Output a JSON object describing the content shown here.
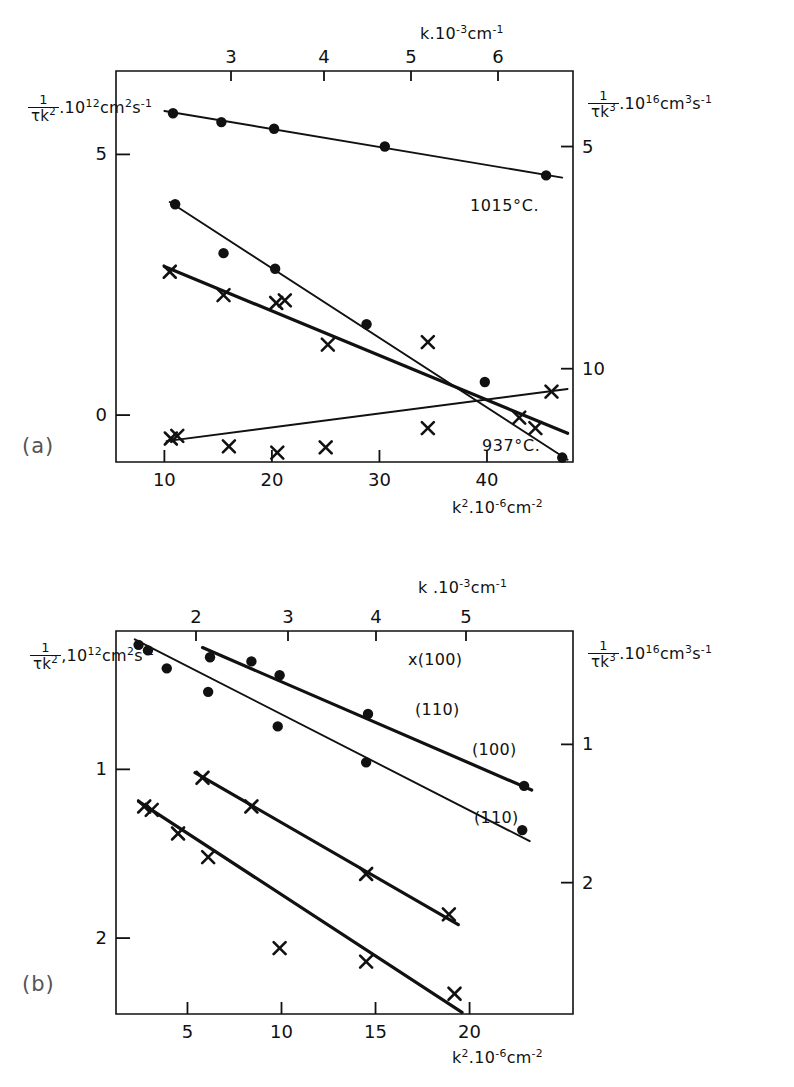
{
  "figure": {
    "background": "#ffffff",
    "ink": "#111111",
    "panels": [
      "a",
      "b"
    ]
  },
  "panel_a": {
    "label": "(a)",
    "top_axis": {
      "title_k": "k",
      "title_dot": ".",
      "title_base": "10",
      "title_exp": "-3",
      "title_unit": "cm",
      "title_unit_exp": "-1",
      "ticks": [
        "3",
        "4",
        "5",
        "6"
      ]
    },
    "bottom_axis": {
      "title_k": "k",
      "title_k_exp": "2",
      "title_dot": ".",
      "title_base": "10",
      "title_exp": "-6",
      "title_unit": "cm",
      "title_unit_exp": "-2",
      "ticks": [
        "10",
        "20",
        "30",
        "40"
      ]
    },
    "left_axis": {
      "num": "1",
      "den": "τk",
      "den_exp": "2",
      "dot": ".",
      "base": "10",
      "exp": "12",
      "unit1": "cm",
      "unit1_exp": "2",
      "unit2": "s",
      "unit2_exp": "-1",
      "ticks": [
        "0",
        "5"
      ]
    },
    "right_axis": {
      "num": "1",
      "den": "τk",
      "den_exp": "3",
      "dot": ".",
      "base": "10",
      "exp": "16",
      "unit1": "cm",
      "unit1_exp": "3",
      "unit2": "s",
      "unit2_exp": "-1",
      "ticks": [
        "10",
        "5"
      ]
    },
    "annotations": [
      {
        "text": "1015°C.",
        "name": "temp-label-1015"
      },
      {
        "text": "937°C.",
        "name": "temp-label-937"
      }
    ]
  },
  "panel_b": {
    "label": "(b)",
    "top_axis": {
      "title_k": "k",
      "title_dot": ".",
      "title_base": "10",
      "title_exp": "-3",
      "title_unit": "cm",
      "title_unit_exp": "-1",
      "ticks": [
        "2",
        "3",
        "4",
        "5"
      ]
    },
    "bottom_axis": {
      "title_k": "k",
      "title_k_exp": "2",
      "title_dot": ".",
      "title_base": "10",
      "title_exp": "-6",
      "title_unit": "cm",
      "title_unit_exp": "-2",
      "ticks": [
        "5",
        "10",
        "15",
        "20"
      ]
    },
    "left_axis": {
      "num": "1",
      "den": "τk",
      "den_exp": "2",
      "dot": ",",
      "base": "10",
      "exp": "12",
      "unit1": "cm",
      "unit1_exp": "2",
      "unit2": "s",
      "unit2_exp": "-1",
      "ticks": [
        "2",
        "1"
      ]
    },
    "right_axis": {
      "num": "1",
      "den": "τk",
      "den_exp": "3",
      "dot": ".",
      "base": "10",
      "exp": "16",
      "unit1": "cm",
      "unit1_exp": "3",
      "unit2": "s",
      "unit2_exp": "-1",
      "ticks": [
        "2",
        "1"
      ]
    },
    "series_labels": [
      {
        "marker": "x",
        "text": "(100)",
        "name": "series-label-x-100"
      },
      {
        "marker": "x",
        "text": "(110)",
        "name": "series-label-x-110"
      },
      {
        "marker": "",
        "text": "(100)",
        "name": "series-label-dot-100"
      },
      {
        "marker": "",
        "text": "(110)",
        "name": "series-label-dot-110"
      }
    ]
  },
  "chart_data": [
    {
      "id": "panel-a",
      "type": "scatter",
      "title": "(a)",
      "xlabel": "k² . 10⁻⁶ cm⁻²",
      "xlabel_top": "k . 10⁻³ cm⁻¹",
      "ylabel": "1/(τk²) . 10¹² cm² s⁻¹",
      "ylabel_right": "1/(τk³) . 10¹⁶ cm³ s⁻¹",
      "xlim": [
        5.5,
        48
      ],
      "xticks": [
        10,
        20,
        30,
        40
      ],
      "xticks_top": [
        3,
        4,
        5,
        6
      ],
      "ylim_left": [
        6.6,
        -0.9
      ],
      "yticks_left": [
        0,
        5
      ],
      "ylim_right": [
        3.3,
        12.1
      ],
      "yticks_right": [
        5,
        10
      ],
      "grid": false,
      "series": [
        {
          "name": "1015°C cross (1/τk²)",
          "marker": "x",
          "axis": "left",
          "points": [
            [
              10.5,
              2.75
            ],
            [
              15.5,
              2.3
            ],
            [
              20.4,
              2.15
            ],
            [
              21.2,
              2.2
            ],
            [
              25.2,
              1.35
            ],
            [
              34.5,
              1.4
            ],
            [
              44.5,
              -0.25
            ]
          ],
          "fit_line": [
            [
              10.0,
              2.85
            ],
            [
              47.5,
              -0.35
            ]
          ],
          "fit_weight": "thick"
        },
        {
          "name": "1015°C filled (1/τk³)",
          "marker": "dot",
          "axis": "right",
          "points": [
            [
              11.0,
              6.3
            ],
            [
              15.5,
              7.4
            ],
            [
              20.3,
              7.75
            ],
            [
              28.8,
              9.0
            ],
            [
              39.8,
              10.3
            ],
            [
              47.0,
              12.0
            ]
          ],
          "fit_line": [
            [
              10.5,
              6.25
            ],
            [
              47.5,
              12.05
            ]
          ],
          "fit_weight": "thin"
        },
        {
          "name": "937°C filled (1/τk³)",
          "marker": "dot",
          "axis": "right",
          "points": [
            [
              10.8,
              4.25
            ],
            [
              15.3,
              4.45
            ],
            [
              20.2,
              4.6
            ],
            [
              30.5,
              5.0
            ],
            [
              45.5,
              5.65
            ]
          ],
          "fit_line": [
            [
              10.0,
              4.2
            ],
            [
              47.0,
              5.7
            ]
          ],
          "fit_weight": "thin"
        },
        {
          "name": "937°C cross (1/τk²)",
          "marker": "x",
          "axis": "left",
          "points": [
            [
              10.6,
              -0.45
            ],
            [
              11.2,
              -0.4
            ],
            [
              16.0,
              -0.6
            ],
            [
              20.5,
              -0.72
            ],
            [
              25.0,
              -0.62
            ],
            [
              34.5,
              -0.25
            ],
            [
              43.0,
              -0.05
            ],
            [
              46.0,
              0.45
            ]
          ],
          "fit_line": [
            [
              10.2,
              -0.5
            ],
            [
              47.5,
              0.5
            ]
          ],
          "fit_weight": "thin"
        }
      ],
      "annotations": [
        {
          "text": "1015°C.",
          "x": 36.5,
          "y_left": 2.05
        },
        {
          "text": "937°C.",
          "x": 38.0,
          "y_left": -0.52
        }
      ]
    },
    {
      "id": "panel-b",
      "type": "scatter",
      "title": "(b)",
      "xlabel": "k² . 10⁻⁶ cm⁻²",
      "xlabel_top": "k . 10⁻³ cm⁻¹",
      "ylabel": "1/(τk²) , 10¹² cm² s⁻¹",
      "ylabel_right": "1/(τk³) . 10¹⁶ cm³ s⁻¹",
      "xlim": [
        1.2,
        25.5
      ],
      "xticks": [
        5,
        10,
        15,
        20
      ],
      "xticks_top": [
        2,
        3,
        4,
        5
      ],
      "ylim_left": [
        0.18,
        2.45
      ],
      "yticks_left": [
        1,
        2
      ],
      "ylim_right": [
        0.18,
        2.95
      ],
      "yticks_right": [
        1,
        2
      ],
      "grid": false,
      "series": [
        {
          "name": "(100) cross",
          "marker": "x",
          "axis": "left",
          "points": [
            [
              2.7,
              1.22
            ],
            [
              3.1,
              1.24
            ],
            [
              4.5,
              1.38
            ],
            [
              6.1,
              1.52
            ],
            [
              9.9,
              2.06
            ],
            [
              14.5,
              2.14
            ],
            [
              19.2,
              2.33
            ]
          ],
          "fit_line": [
            [
              2.4,
              1.19
            ],
            [
              19.6,
              2.44
            ]
          ],
          "fit_weight": "thick"
        },
        {
          "name": "(110) cross",
          "marker": "x",
          "axis": "left",
          "points": [
            [
              5.8,
              1.05
            ],
            [
              8.4,
              1.22
            ],
            [
              14.5,
              1.62
            ],
            [
              18.9,
              1.86
            ]
          ],
          "fit_line": [
            [
              5.4,
              1.02
            ],
            [
              19.4,
              1.92
            ]
          ],
          "fit_weight": "thick"
        },
        {
          "name": "(100) filled",
          "marker": "dot",
          "axis": "right",
          "points": [
            [
              2.4,
              0.28
            ],
            [
              2.9,
              0.32
            ],
            [
              3.9,
              0.45
            ],
            [
              6.1,
              0.62
            ],
            [
              9.8,
              0.87
            ],
            [
              14.5,
              1.13
            ],
            [
              22.8,
              1.62
            ]
          ],
          "fit_line": [
            [
              2.2,
              0.24
            ],
            [
              23.2,
              1.7
            ]
          ],
          "fit_weight": "thin"
        },
        {
          "name": "(110) filled",
          "marker": "dot",
          "axis": "right",
          "points": [
            [
              6.2,
              0.37
            ],
            [
              8.4,
              0.4
            ],
            [
              9.9,
              0.5
            ],
            [
              14.6,
              0.78
            ],
            [
              22.9,
              1.3
            ]
          ],
          "fit_line": [
            [
              5.8,
              0.3
            ],
            [
              23.3,
              1.33
            ]
          ],
          "fit_weight": "thick"
        }
      ],
      "annotations": [
        {
          "text": "x(100)",
          "x": 20.2,
          "y_left": 2.4
        },
        {
          "text": "(110)",
          "x": 20.0,
          "y_left": 1.98
        },
        {
          "text": "(100)",
          "x": 23.4,
          "y_left": 1.62
        },
        {
          "text": "(110)",
          "x": 23.5,
          "y_left": 1.2
        }
      ]
    }
  ]
}
